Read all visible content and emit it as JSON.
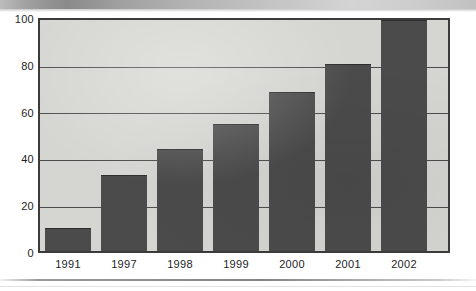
{
  "chart_data": {
    "type": "bar",
    "title": "",
    "subtitle": "",
    "xlabel": "",
    "ylabel": "",
    "categories": [
      "1991",
      "1997",
      "1998",
      "1999",
      "2000",
      "2001",
      "2002"
    ],
    "values": [
      10,
      33,
      44,
      55,
      69,
      81,
      100
    ],
    "ylim": [
      0,
      100
    ],
    "yticks": [
      0,
      20,
      40,
      60,
      80,
      100
    ],
    "ytick_labels": [
      "0",
      "20",
      "40",
      "60",
      "80",
      "100"
    ],
    "grid": true,
    "grid_axis": "y",
    "legend": false,
    "legend_position": "none",
    "series": [
      {
        "name": "",
        "values": [
          10,
          33,
          44,
          55,
          69,
          81,
          100
        ]
      }
    ],
    "colors": {
      "bar_fill": "#4b4b4b",
      "plot_background": "#d5d5d1",
      "axis_line": "#3b3b3b",
      "gridline": "#4c4c4c",
      "tick_label": "#1d1d1d",
      "page_background": "#ffffff"
    }
  }
}
